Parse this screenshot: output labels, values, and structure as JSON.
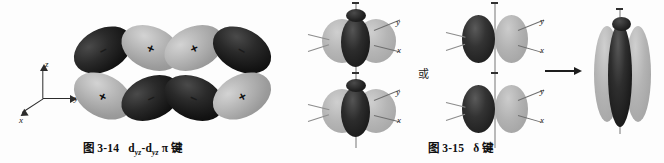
{
  "page": {
    "background_color": "#fdfdfd",
    "width": 664,
    "height": 163,
    "kind": "textbook-figure-pair"
  },
  "figures": [
    {
      "id": "fig-3-14",
      "caption_number": "图 3-14",
      "caption_body": "d",
      "caption_sub1": "yz",
      "caption_mid": "-d",
      "caption_sub2": "yz",
      "caption_tail": "π 键",
      "caption_full": "图 3-14  dyz-dyz π 键",
      "axes": {
        "z_label": "z",
        "y_label": "y",
        "x_label": "x"
      },
      "orbital_lobes": [
        {
          "position": "top-far-left",
          "sign": "−",
          "shade": "dark"
        },
        {
          "position": "top-left",
          "sign": "+",
          "shade": "light"
        },
        {
          "position": "top-right",
          "sign": "+",
          "shade": "light"
        },
        {
          "position": "top-far-right",
          "sign": "−",
          "shade": "dark"
        },
        {
          "position": "bottom-far-left",
          "sign": "+",
          "shade": "light"
        },
        {
          "position": "bottom-left",
          "sign": "−",
          "shade": "dark"
        },
        {
          "position": "bottom-right",
          "sign": "−",
          "shade": "dark"
        },
        {
          "position": "bottom-far-right",
          "sign": "+",
          "shade": "light"
        }
      ]
    },
    {
      "id": "fig-3-15",
      "caption_number": "图 3-15",
      "caption_tail": "δ 键",
      "caption_full": "图 3-15  δ 键",
      "or_label": "或",
      "arrow_glyph": "→",
      "panels": [
        {
          "name": "clover-pair-face-on",
          "orbitals": [
            {
              "axis_y": "y",
              "axis_x": "x",
              "row": "top"
            },
            {
              "axis_y": "y",
              "axis_x": "x",
              "row": "bottom"
            }
          ]
        },
        {
          "name": "two-lobe-pair-side-on",
          "orbitals": [
            {
              "axis_y": "y",
              "axis_x": "x",
              "row": "top"
            },
            {
              "axis_y": "y",
              "axis_x": "x",
              "row": "bottom"
            }
          ]
        },
        {
          "name": "merged-delta-orbital",
          "orbitals": []
        }
      ]
    }
  ],
  "colors": {
    "lobe_dark": "#141414",
    "lobe_light": "#a8a8a8",
    "axis": "#2b2b2b",
    "vertical_axis": "#b9b9b9",
    "text": "#101010",
    "background": "#fdfdfd"
  }
}
